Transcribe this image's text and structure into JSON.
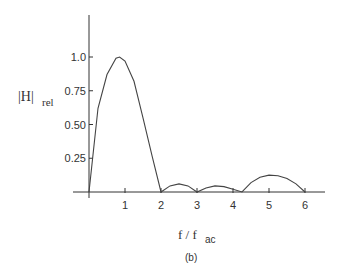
{
  "chart_data": {
    "type": "line",
    "title": "",
    "caption": "(b)",
    "xlabel": "f / f_ac",
    "xlabel_main": "f / f",
    "xlabel_sub": "ac",
    "ylabel": "|H|_rel",
    "ylabel_main": "|H|",
    "ylabel_sub": "rel",
    "xlim": [
      0,
      6.5
    ],
    "ylim": [
      0,
      1.25
    ],
    "grid": false,
    "x_ticks": [
      1,
      2,
      3,
      4,
      5,
      6
    ],
    "x_tick_labels": [
      "1",
      "2",
      "3",
      "4",
      "5",
      "6"
    ],
    "y_ticks": [
      0.25,
      0.5,
      0.75,
      1.0
    ],
    "y_tick_labels": [
      "0.25",
      "0.50",
      "0.75",
      "1.0"
    ],
    "series": [
      {
        "name": "|H|rel",
        "x": [
          0,
          0.25,
          0.5,
          0.75,
          0.85,
          1.0,
          1.25,
          1.5,
          1.75,
          2.0,
          2.25,
          2.5,
          2.75,
          3.0,
          3.25,
          3.5,
          3.75,
          4.0,
          4.25,
          4.5,
          4.75,
          5.0,
          5.25,
          5.5,
          5.75,
          6.0
        ],
        "y": [
          0,
          0.62,
          0.87,
          0.99,
          1.0,
          0.97,
          0.82,
          0.55,
          0.27,
          0.0,
          0.045,
          0.06,
          0.045,
          0.0,
          0.03,
          0.045,
          0.04,
          0.02,
          0.0,
          0.07,
          0.11,
          0.125,
          0.12,
          0.1,
          0.06,
          0.0
        ]
      }
    ]
  }
}
